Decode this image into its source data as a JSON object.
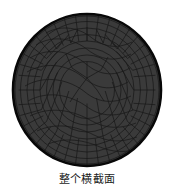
{
  "figure": {
    "caption": "整个横截面",
    "colors": {
      "background": "#ffffff",
      "mesh_fill": "#3a3a3a",
      "mesh_line": "#1c1c1c",
      "outline": "#080808",
      "caption_text": "#1a1a1a"
    },
    "geometry": {
      "shape": "circle",
      "center_x": 87,
      "center_y": 90,
      "radius_x": 75,
      "radius_y": 77,
      "outline_width": 2.5
    },
    "mesh": {
      "type": "quadrilateral-finite-element",
      "description": "circular cross-section quad mesh with curved interior seam and radial boundary layer",
      "radial_rings": 9,
      "angular_divisions": 40,
      "interior_seam": "curved",
      "line_width": 0.7
    }
  }
}
